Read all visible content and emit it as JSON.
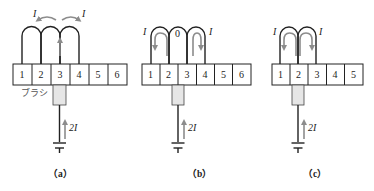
{
  "figure": {
    "colors": {
      "line": "#222222",
      "arrow": "#8c8c8c",
      "brush_fill": "#e6e6e6",
      "segment_fill": "#ffffff"
    },
    "panels": [
      {
        "id": "a",
        "caption": "（a）",
        "segments": [
          "1",
          "2",
          "3",
          "4",
          "5",
          "6"
        ],
        "current_left": "I",
        "current_right": "I",
        "center_label": "",
        "brush_label": "ブラシ",
        "supply_current": "2I"
      },
      {
        "id": "b",
        "caption": "（b）",
        "segments": [
          "1",
          "2",
          "3",
          "4",
          "5",
          "6"
        ],
        "current_left": "I",
        "current_right": "I",
        "center_label": "0",
        "brush_label": "",
        "supply_current": "2I"
      },
      {
        "id": "c",
        "caption": "（c）",
        "segments": [
          "1",
          "2",
          "3",
          "4",
          "5"
        ],
        "current_left": "I",
        "current_right": "I",
        "center_label": "",
        "brush_label": "",
        "supply_current": "2I"
      }
    ]
  }
}
